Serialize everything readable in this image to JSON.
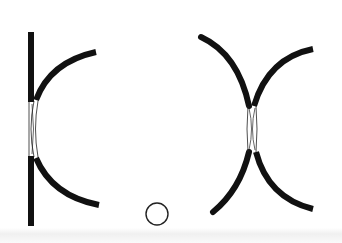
{
  "figure": {
    "colors": {
      "stroke": "#111111",
      "background": "#ffffff",
      "neck_line": "#222222"
    },
    "left_pair": {
      "label": "",
      "parts": [
        "vertical-wall",
        "upper-arc",
        "lower-arc",
        "neck-region"
      ]
    },
    "right_pair": {
      "label": "",
      "parts": [
        "upper-left-arc",
        "upper-right-arc",
        "lower-left-arc",
        "lower-right-arc",
        "neck-region"
      ]
    },
    "marker": {
      "shape": "open-circle"
    }
  }
}
